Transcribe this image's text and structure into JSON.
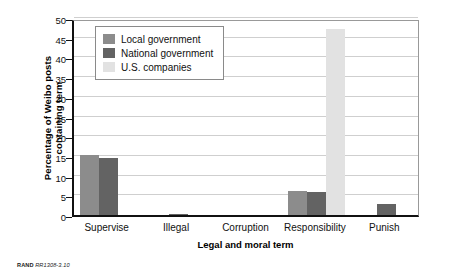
{
  "chart_data": {
    "type": "bar",
    "title": "",
    "subtitle": "",
    "xlabel": "Legal and moral term",
    "ylabel": "Percentage of Weibo posts containing term",
    "ylabel_line1": "Percentage of Weibo posts",
    "ylabel_line2": "containing term",
    "categories": [
      "Supervise",
      "Illegal",
      "Corruption",
      "Responsibility",
      "Punish"
    ],
    "series": [
      {
        "name": "Local government",
        "color": "#8c8c8c",
        "values": [
          15.2,
          0,
          0,
          6.0,
          0
        ]
      },
      {
        "name": "National government",
        "color": "#636363",
        "values": [
          14.4,
          0.3,
          0,
          5.8,
          2.7
        ]
      },
      {
        "name": "U.S. companies",
        "color": "#e2e2e2",
        "values": [
          0,
          0,
          0,
          47.2,
          0
        ]
      }
    ],
    "ylim": [
      0,
      50
    ],
    "ytick_values": [
      0,
      5,
      10,
      15,
      20,
      25,
      30,
      35,
      40,
      45,
      50
    ],
    "ytick_labels": [
      "0",
      "5",
      "10",
      "15",
      "20",
      "25",
      "30",
      "35",
      "40",
      "45",
      "50"
    ],
    "grid": true,
    "legend_position": "upper-left-inside"
  },
  "legend": {
    "items": [
      {
        "label": "Local government",
        "color": "#8c8c8c"
      },
      {
        "label": "National government",
        "color": "#636363"
      },
      {
        "label": "U.S. companies",
        "color": "#e2e2e2"
      }
    ]
  },
  "footer": {
    "source": "RAND",
    "document_id": "RR1308-3.10"
  }
}
